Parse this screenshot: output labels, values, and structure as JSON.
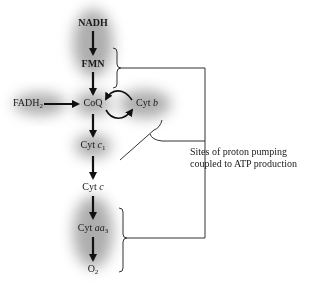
{
  "diagram": {
    "nodes": [
      {
        "id": "nadh",
        "label": "NADH"
      },
      {
        "id": "fmn",
        "label": "FMN"
      },
      {
        "id": "fadh2",
        "label": "FADH",
        "subscript": "2"
      },
      {
        "id": "coq",
        "label": "CoQ"
      },
      {
        "id": "cytb",
        "label": "Cyt ",
        "italic": "b"
      },
      {
        "id": "cytc1",
        "label": "Cyt ",
        "italic": "c",
        "subscript": "1"
      },
      {
        "id": "cytc",
        "label": "Cyt ",
        "italic": "c"
      },
      {
        "id": "cytaa3",
        "label": "Cyt ",
        "italic": "aa",
        "subscript": "3"
      },
      {
        "id": "o2",
        "label": "O",
        "subscript": "2"
      }
    ],
    "edges": [
      {
        "from": "NADH",
        "to": "FMN"
      },
      {
        "from": "FMN",
        "to": "CoQ"
      },
      {
        "from": "FADH2",
        "to": "CoQ"
      },
      {
        "from": "CoQ",
        "to": "Cyt b"
      },
      {
        "from": "Cyt b",
        "to": "CoQ"
      },
      {
        "from": "CoQ",
        "to": "Cyt c1"
      },
      {
        "from": "Cyt c1",
        "to": "Cyt c"
      },
      {
        "from": "Cyt c",
        "to": "Cyt aa3"
      },
      {
        "from": "Cyt aa3",
        "to": "O2"
      }
    ],
    "annotation": {
      "line1": "Sites of proton pumping",
      "line2": "coupled to ATP production"
    },
    "colors": {
      "text": "#1a1a1a",
      "arrow": "#111111",
      "shadow": "#6b6b6b",
      "bracket": "#333333"
    }
  }
}
